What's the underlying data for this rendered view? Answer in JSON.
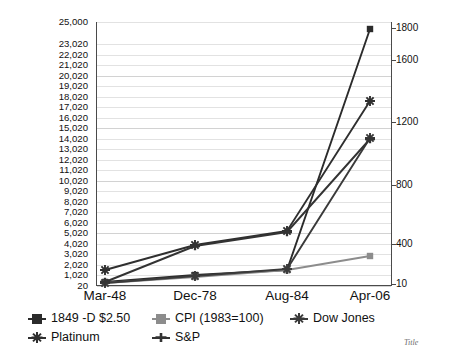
{
  "corner_note": "Title",
  "axes": {
    "x_labels": [
      "Mar-48",
      "Dec-78",
      "Aug-84",
      "Apr-06"
    ],
    "y_left_labels": [
      "25,000",
      "23,020",
      "22,020",
      "21,020",
      "20,020",
      "19,020",
      "18,020",
      "17,020",
      "16,020",
      "15,020",
      "14,020",
      "13,020",
      "12,020",
      "11,020",
      "10,020",
      "9,020",
      "8,020",
      "7,020",
      "6,020",
      "5,020",
      "4,020",
      "3,020",
      "2,020",
      "1,020",
      "20"
    ],
    "y_right_labels": [
      "1800",
      "1600",
      "1200",
      "800",
      "400",
      "10"
    ]
  },
  "legend": {
    "items": [
      {
        "label": "1849 -D $2.50",
        "marker": "square",
        "color": "#2b2b2b"
      },
      {
        "label": "CPI (1983=100)",
        "marker": "square",
        "color": "#8c8c8c"
      },
      {
        "label": "Dow Jones",
        "marker": "star",
        "color": "#3a3a3a"
      },
      {
        "label": "Platinum",
        "marker": "star",
        "color": "#2f2f2f"
      },
      {
        "label": "S&P",
        "marker": "plus",
        "color": "#333333"
      }
    ]
  },
  "chart_data": {
    "type": "line",
    "title": "",
    "xlabel": "",
    "ylabel": "",
    "grid": true,
    "legend_position": "bottom",
    "categories": [
      "Mar-48",
      "Dec-78",
      "Aug-84",
      "Apr-06"
    ],
    "ylim_left": [
      20,
      25000
    ],
    "ylim_right": [
      10,
      1800
    ],
    "y_left_ticks": [
      20,
      1020,
      2020,
      3020,
      4020,
      5020,
      6020,
      7020,
      8020,
      9020,
      10020,
      11020,
      12020,
      13020,
      14020,
      15020,
      16020,
      17020,
      18020,
      19020,
      20020,
      21020,
      22020,
      23020,
      25000
    ],
    "y_right_ticks": [
      10,
      400,
      800,
      1200,
      1600,
      1800
    ],
    "series": [
      {
        "name": "1849 -D $2.50",
        "axis": "left",
        "color": "#2b2b2b",
        "marker": "square",
        "values": [
          300,
          1300,
          2100,
          23200
        ]
      },
      {
        "name": "CPI (1983=100)",
        "axis": "left",
        "color": "#8c8c8c",
        "marker": "square",
        "values": [
          250,
          1250,
          1900,
          3100
        ]
      },
      {
        "name": "Dow Jones",
        "axis": "right",
        "color": "#3a3a3a",
        "marker": "star",
        "values": [
          180,
          810,
          1220,
          11200
        ]
      },
      {
        "name": "Platinum",
        "axis": "left",
        "color": "#2f2f2f",
        "marker": "star",
        "values": [
          1050,
          3700,
          5300,
          17600
        ]
      },
      {
        "name": "S&P",
        "axis": "left",
        "color": "#333333",
        "marker": "plus",
        "values": [
          280,
          3650,
          5200,
          13700
        ]
      }
    ],
    "plot_points_px": {
      "x": [
        105,
        195,
        287,
        370
      ],
      "series_y": {
        "1849 -D $2.50": [
          282,
          275,
          270,
          29
        ],
        "CPI (1983=100)": [
          283,
          277,
          270,
          256
        ],
        "Dow Jones": [
          283,
          276,
          269,
          138
        ],
        "Platinum": [
          270,
          245,
          231,
          101
        ],
        "S&P": [
          282,
          246,
          232,
          139
        ]
      }
    }
  }
}
